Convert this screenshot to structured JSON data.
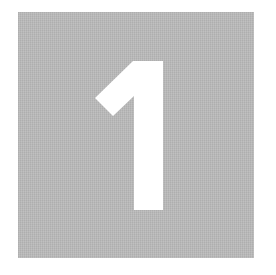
{
  "tile": {
    "numeral": "1",
    "background_color": "#b9b9b9",
    "numeral_color": "#ffffff"
  }
}
